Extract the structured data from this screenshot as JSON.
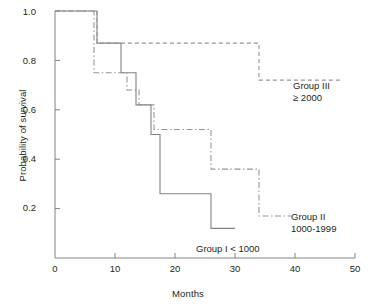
{
  "chart_data": {
    "type": "line",
    "subtype": "kaplan-meier-step",
    "title": "",
    "xlabel": "Months",
    "ylabel": "Probability of survival",
    "xlim": [
      0,
      50
    ],
    "ylim": [
      0,
      1.0
    ],
    "xticks": [
      0,
      10,
      20,
      30,
      40,
      50
    ],
    "xtick_labels": [
      "0",
      "10",
      "20",
      "30",
      "40",
      "50"
    ],
    "yticks": [
      0.2,
      0.4,
      0.6,
      0.8,
      1.0
    ],
    "ytick_labels": [
      "0.2",
      "0.4",
      "0.6",
      "0.8",
      "1.0"
    ],
    "grid": false,
    "legend": "inline-annotations",
    "spines": [
      "left",
      "bottom"
    ],
    "series": [
      {
        "name": "Group I",
        "label_line1": "Group I < 1000",
        "label_line2": "",
        "linestyle": "solid",
        "color": "#808285",
        "x": [
          0,
          7,
          7,
          11,
          11,
          13.5,
          13.5,
          16,
          16,
          17.5,
          17.5,
          26,
          26,
          30
        ],
        "y": [
          1.0,
          1.0,
          0.87,
          0.87,
          0.75,
          0.75,
          0.62,
          0.62,
          0.5,
          0.5,
          0.26,
          0.26,
          0.12,
          0.12
        ],
        "steps": [
          {
            "months": 0,
            "survival": 1.0
          },
          {
            "months": 7,
            "survival": 0.87
          },
          {
            "months": 11,
            "survival": 0.75
          },
          {
            "months": 13.5,
            "survival": 0.62
          },
          {
            "months": 16,
            "survival": 0.5
          },
          {
            "months": 17.5,
            "survival": 0.26
          },
          {
            "months": 26,
            "survival": 0.12
          },
          {
            "months": 30,
            "survival": 0.12
          }
        ]
      },
      {
        "name": "Group II",
        "label_line1": "Group II",
        "label_line2": "1000-1999",
        "linestyle": "dashdot",
        "color": "#939598",
        "x": [
          0,
          6.5,
          6.5,
          12,
          12,
          14,
          14,
          16.5,
          16.5,
          26,
          26,
          34,
          34,
          41
        ],
        "y": [
          1.0,
          1.0,
          0.75,
          0.75,
          0.68,
          0.68,
          0.62,
          0.62,
          0.52,
          0.52,
          0.36,
          0.36,
          0.17,
          0.17
        ],
        "steps": [
          {
            "months": 0,
            "survival": 1.0
          },
          {
            "months": 6.5,
            "survival": 0.75
          },
          {
            "months": 12,
            "survival": 0.68
          },
          {
            "months": 14,
            "survival": 0.62
          },
          {
            "months": 16.5,
            "survival": 0.52
          },
          {
            "months": 26,
            "survival": 0.36
          },
          {
            "months": 34,
            "survival": 0.17
          },
          {
            "months": 41,
            "survival": 0.17
          }
        ]
      },
      {
        "name": "Group III",
        "label_line1": "Group III",
        "label_line2": "≥ 2000",
        "linestyle": "dashed",
        "color": "#939598",
        "x": [
          0,
          7,
          7,
          34,
          34,
          48
        ],
        "y": [
          1.0,
          1.0,
          0.87,
          0.87,
          0.72,
          0.72
        ],
        "steps": [
          {
            "months": 0,
            "survival": 1.0
          },
          {
            "months": 7,
            "survival": 0.87
          },
          {
            "months": 34,
            "survival": 0.72
          },
          {
            "months": 48,
            "survival": 0.72
          }
        ]
      }
    ],
    "annotations": [
      {
        "text": "Group III",
        "x": 44,
        "y": 0.79
      },
      {
        "text": "≥ 2000",
        "x": 44,
        "y": 0.72
      },
      {
        "text": "Group II",
        "x": 43,
        "y": 0.26
      },
      {
        "text": "1000-1999",
        "x": 43,
        "y": 0.19
      },
      {
        "text": "Group I < 1000",
        "x": 23,
        "y": 0.06
      }
    ]
  },
  "colors": {
    "axis": "#808285",
    "text": "#231f20",
    "series_solid": "#808285",
    "series_dashdot": "#939598",
    "series_dashed": "#939598",
    "background": "#ffffff"
  }
}
